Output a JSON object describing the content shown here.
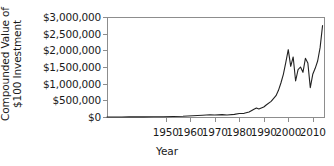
{
  "chart_data": {
    "type": "line",
    "title": "",
    "xlabel": "Year",
    "ylabel": "Compounded Value of $100 Investment",
    "ylabel_line1": "Compounded Value of",
    "ylabel_line2": "$100 Investment",
    "xlim": [
      1926,
      2015
    ],
    "ylim": [
      0,
      3000000
    ],
    "grid": false,
    "legend": null,
    "line_color": "#222222",
    "axis_color": "#8d8d8d",
    "xticks": [
      1950,
      1960,
      1970,
      1980,
      1990,
      2000,
      2010
    ],
    "xtick_labels": [
      "1950",
      "1960",
      "1970",
      "1980",
      "1990",
      "2000",
      "2010"
    ],
    "yticks": [
      0,
      500000,
      1000000,
      1500000,
      2000000,
      2500000,
      3000000
    ],
    "ytick_labels": [
      "$0",
      "$500,000",
      "$1,000,000",
      "$1,500,000",
      "$2,000,000",
      "$2,500,000",
      "$3,000,000"
    ],
    "series": [
      {
        "name": "Compounded value of $100 investment",
        "x": [
          1926,
          1929,
          1932,
          1935,
          1938,
          1941,
          1945,
          1949,
          1953,
          1957,
          1961,
          1965,
          1968,
          1970,
          1973,
          1975,
          1978,
          1980,
          1982,
          1984,
          1986,
          1987,
          1988,
          1990,
          1991,
          1993,
          1995,
          1996,
          1997,
          1998,
          1999,
          2000,
          2001,
          2002,
          2003,
          2004,
          2005,
          2006,
          2007,
          2008,
          2009,
          2010,
          2011,
          2012,
          2013,
          2014
        ],
        "y": [
          100,
          2200,
          700,
          3200,
          3000,
          2600,
          7000,
          9000,
          17000,
          21000,
          38000,
          52000,
          66000,
          60000,
          70000,
          62000,
          78000,
          104000,
          110000,
          150000,
          230000,
          268000,
          240000,
          300000,
          360000,
          470000,
          640000,
          800000,
          1020000,
          1280000,
          1640000,
          2020000,
          1520000,
          1800000,
          1080000,
          1420000,
          1500000,
          1340000,
          1760000,
          1620000,
          880000,
          1280000,
          1460000,
          1680000,
          2080000,
          2740000
        ]
      }
    ]
  },
  "axes_geometry": {
    "plot_left_px": 107,
    "plot_right_px": 325,
    "plot_top_px": 17,
    "plot_bottom_px": 117
  }
}
